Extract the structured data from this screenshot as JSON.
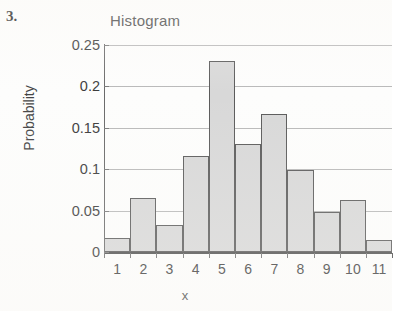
{
  "worksheet": {
    "problem_number": "3."
  },
  "chart_data": {
    "type": "bar",
    "title": "Histogram",
    "xlabel": "x",
    "ylabel": "Probability",
    "categories": [
      "1",
      "2",
      "3",
      "4",
      "5",
      "6",
      "7",
      "8",
      "9",
      "10",
      "11"
    ],
    "values": [
      0.017,
      0.065,
      0.033,
      0.116,
      0.231,
      0.13,
      0.167,
      0.099,
      0.048,
      0.063,
      0.014
    ],
    "ylim": [
      0,
      0.25
    ],
    "yticks": [
      "0",
      "0.05",
      "0.1",
      "0.15",
      "0.2",
      "0.25"
    ],
    "ytick_values": [
      0,
      0.05,
      0.1,
      0.15,
      0.2,
      0.25
    ],
    "grid": "horizontal",
    "legend": "none",
    "bar_fill_color": "#d8d8d8",
    "bar_border_color": "#5a5a5a",
    "gridline_color": "#b9b9b9",
    "axis_color": "#4c4c4c",
    "clipped_right_edge": true
  }
}
